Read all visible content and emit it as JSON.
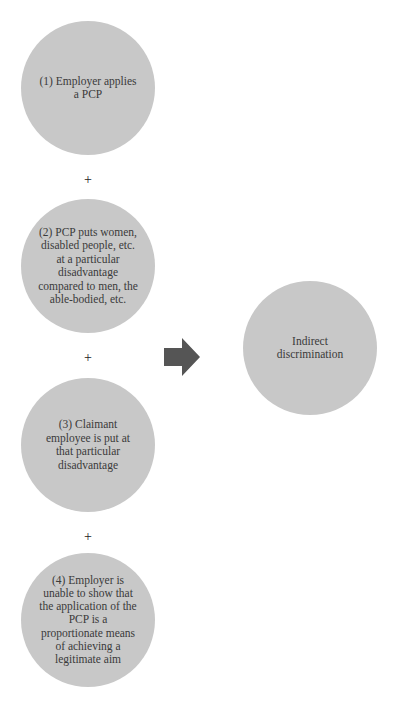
{
  "diagram": {
    "type": "flow",
    "colors": {
      "circle_fill": "#c8c8c8",
      "arrow_fill": "#555555",
      "text": "#3a3a3a",
      "background": "#ffffff"
    },
    "conditions": [
      {
        "label": "(1) Employer applies a PCP"
      },
      {
        "label": "(2) PCP puts women, disabled people, etc. at a particular disadvantage compared to men, the able-bodied, etc."
      },
      {
        "label": "(3) Claimant employee is put at that particular disadvantage"
      },
      {
        "label": "(4) Employer is unable to show that the application of the PCP is a proportionate means of achieving a legitimate aim"
      }
    ],
    "connectors": [
      "+",
      "+",
      "+"
    ],
    "arrow_icon": "right-arrow",
    "result": {
      "label": "Indirect discrimination"
    }
  }
}
